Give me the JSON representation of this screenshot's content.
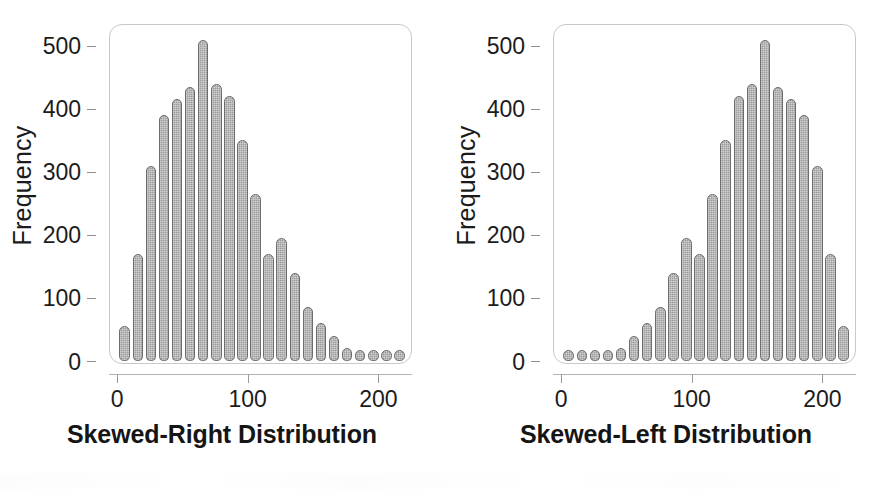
{
  "figure": {
    "background_color": "#ffffff",
    "bar_fill_color": "#9d9d9d",
    "bar_edge_color": "#6d6d6d",
    "frame_color": "#c9c9c9",
    "text_color": "#1b1b1b"
  },
  "chart_data": [
    {
      "type": "bar",
      "title": "Skewed-Right Distribution",
      "xlabel": "",
      "ylabel": "Frequency",
      "xlim": [
        0,
        232
      ],
      "ylim": [
        0,
        530
      ],
      "xticks": [
        0,
        100,
        200
      ],
      "xtick_labels": [
        "0",
        "100",
        "200"
      ],
      "yticks": [
        0,
        100,
        200,
        300,
        400,
        500
      ],
      "ytick_labels": [
        "0",
        "100",
        "200",
        "300",
        "400",
        "500"
      ],
      "grid": false,
      "legend": "none",
      "bin_width": 10,
      "bin_centers": [
        10,
        20,
        30,
        40,
        50,
        60,
        70,
        80,
        90,
        100,
        110,
        120,
        130,
        140,
        150,
        160,
        170,
        180,
        190,
        200,
        210,
        220
      ],
      "categories": [
        "10",
        "20",
        "30",
        "40",
        "50",
        "60",
        "70",
        "80",
        "90",
        "100",
        "110",
        "120",
        "130",
        "140",
        "150",
        "160",
        "170",
        "180",
        "190",
        "200",
        "210",
        "220"
      ],
      "values": [
        55,
        170,
        310,
        390,
        415,
        435,
        510,
        440,
        420,
        350,
        265,
        170,
        195,
        140,
        85,
        60,
        40,
        20,
        10,
        8,
        8,
        8
      ]
    },
    {
      "type": "bar",
      "title": "Skewed-Left Distribution",
      "xlabel": "",
      "ylabel": "Frequency",
      "xlim": [
        0,
        232
      ],
      "ylim": [
        0,
        530
      ],
      "xticks": [
        0,
        100,
        200
      ],
      "xtick_labels": [
        "0",
        "100",
        "200"
      ],
      "yticks": [
        0,
        100,
        200,
        300,
        400,
        500
      ],
      "ytick_labels": [
        "0",
        "100",
        "200",
        "300",
        "400",
        "500"
      ],
      "grid": false,
      "legend": "none",
      "bin_width": 10,
      "bin_centers": [
        10,
        20,
        30,
        40,
        50,
        60,
        70,
        80,
        90,
        100,
        110,
        120,
        130,
        140,
        150,
        160,
        170,
        180,
        190,
        200,
        210,
        220
      ],
      "categories": [
        "10",
        "20",
        "30",
        "40",
        "50",
        "60",
        "70",
        "80",
        "90",
        "100",
        "110",
        "120",
        "130",
        "140",
        "150",
        "160",
        "170",
        "180",
        "190",
        "200",
        "210",
        "220"
      ],
      "values": [
        8,
        8,
        8,
        10,
        20,
        40,
        60,
        85,
        140,
        195,
        170,
        265,
        350,
        420,
        440,
        510,
        435,
        415,
        390,
        310,
        170,
        55
      ]
    }
  ],
  "panels": [
    {
      "id": "skewed-right",
      "title": "Skewed-Right Distribution",
      "ylabel": "Frequency"
    },
    {
      "id": "skewed-left",
      "title": "Skewed-Left Distribution",
      "ylabel": "Frequency"
    }
  ]
}
